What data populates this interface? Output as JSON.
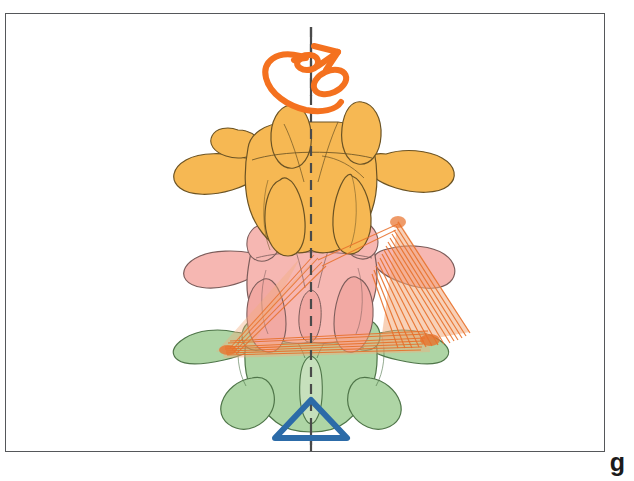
{
  "figure": {
    "caption_label": "g",
    "panel_border_color": "#55575a",
    "background_color": "#ffffff"
  },
  "axis": {
    "name": "vertical-midline-axis",
    "style": "dashed",
    "color": "#4a4a4a",
    "x": 311,
    "y_top": 27,
    "y_bottom": 452,
    "dash_pattern": "10 7"
  },
  "symbols": {
    "rotation_arrow": {
      "name": "rotation-arrow-symbol",
      "color": "#F4711F",
      "description": "curved double-loop rotation arrow around the vertical axis",
      "stroke_width": 6,
      "center_x": 311,
      "center_y": 65
    },
    "fixed_support": {
      "name": "fixed-support-triangle",
      "color": "#2C6BA8",
      "description": "blue open triangle marking the fixed reference vertebra",
      "stroke_width": 6,
      "center_x": 311,
      "center_y": 423
    }
  },
  "vertebrae": [
    {
      "id": "vertebra-superior",
      "label": "Superior vertebra (rotated)",
      "fill": "#F6B853",
      "stroke": "#6b5324",
      "order": 1,
      "color_name": "orange"
    },
    {
      "id": "vertebra-middle",
      "label": "Middle vertebra (intermediate rotation)",
      "fill": "#F6B7B2",
      "stroke": "#7c5d5b",
      "order": 2,
      "color_name": "pink"
    },
    {
      "id": "vertebra-inferior",
      "label": "Inferior vertebra (fixed)",
      "fill": "#AED5A5",
      "stroke": "#4f7549",
      "order": 3,
      "color_name": "green"
    }
  ],
  "ligaments": {
    "name": "alar-ligament-fibers",
    "fiber_color": "#E8702A",
    "fan_fill": "#F2AC7E",
    "description": "fanned orange ligament / muscle fiber bundles spanning between vertebral levels",
    "bundle_count": 2
  }
}
